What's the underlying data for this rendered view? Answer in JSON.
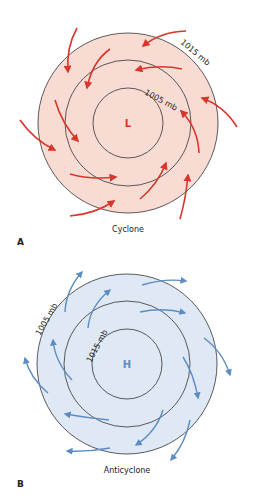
{
  "panels": [
    {
      "id": "A",
      "letter": "A",
      "title": "Cyclone",
      "center_label": "L",
      "inner_isobar": "1005 mb",
      "outer_isobar": "1015 mb",
      "fill": "#f8dcd3",
      "arrow_color": "#d9352a",
      "center_color": "#d9352a",
      "flow": "inward counterclockwise"
    },
    {
      "id": "B",
      "letter": "B",
      "title": "Anticyclone",
      "center_label": "H",
      "inner_isobar": "1015 mb",
      "outer_isobar": "1005 mb",
      "fill": "#dfe8f5",
      "arrow_color": "#5b8cc4",
      "center_color": "#5b8cc4",
      "flow": "outward clockwise"
    }
  ]
}
